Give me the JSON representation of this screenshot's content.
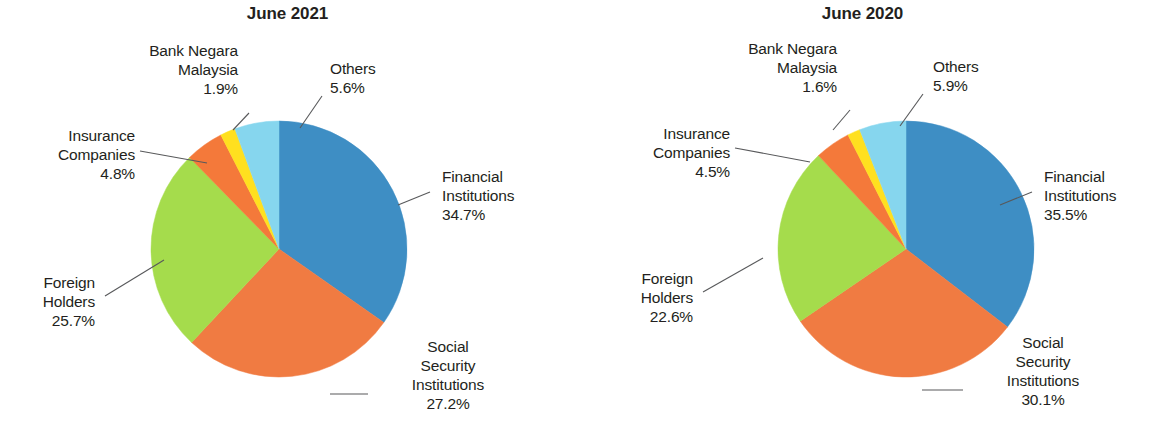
{
  "colors": {
    "financial_institutions": "#3e8ec4",
    "social_security_institutions": "#f07b42",
    "foreign_holders": "#a5dc4c",
    "insurance_companies": "#f4793a",
    "bank_negara_malaysia": "#ffe01f",
    "others": "#86d6ee",
    "leader_line": "#58595b",
    "text": "#231f20",
    "background": "#ffffff"
  },
  "charts": [
    {
      "title": "June 2021",
      "labels": {
        "financial_institutions": {
          "name_line1": "Financial",
          "name_line2": "Institutions",
          "value": "34.7%"
        },
        "social_security": {
          "name_line1": "Social",
          "name_line2": "Security",
          "name_line3": "Institutions",
          "value": "27.2%"
        },
        "foreign_holders": {
          "name_line1": "Foreign",
          "name_line2": "Holders",
          "value": "25.7%"
        },
        "insurance_companies": {
          "name_line1": "Insurance",
          "name_line2": "Companies",
          "value": "4.8%"
        },
        "bank_negara": {
          "name_line1": "Bank Negara",
          "name_line2": "Malaysia",
          "value": "1.9%"
        },
        "others": {
          "name_line1": "Others",
          "value": "5.6%"
        }
      }
    },
    {
      "title": "June 2020",
      "labels": {
        "financial_institutions": {
          "name_line1": "Financial",
          "name_line2": "Institutions",
          "value": "35.5%"
        },
        "social_security": {
          "name_line1": "Social",
          "name_line2": "Security",
          "name_line3": "Institutions",
          "value": "30.1%"
        },
        "foreign_holders": {
          "name_line1": "Foreign",
          "name_line2": "Holders",
          "value": "22.6%"
        },
        "insurance_companies": {
          "name_line1": "Insurance",
          "name_line2": "Companies",
          "value": "4.5%"
        },
        "bank_negara": {
          "name_line1": "Bank Negara",
          "name_line2": "Malaysia",
          "value": "1.6%"
        },
        "others": {
          "name_line1": "Others",
          "value": "5.9%"
        }
      }
    }
  ],
  "chart_data": [
    {
      "type": "pie",
      "title": "June 2021",
      "categories": [
        "Financial Institutions",
        "Social Security Institutions",
        "Foreign Holders",
        "Insurance Companies",
        "Bank Negara Malaysia",
        "Others"
      ],
      "values": [
        34.7,
        27.2,
        25.7,
        4.8,
        1.9,
        5.6
      ],
      "unit": "%",
      "colors": [
        "#3e8ec4",
        "#f07b42",
        "#a5dc4c",
        "#f4793a",
        "#ffe01f",
        "#86d6ee"
      ],
      "start_angle_deg": 0,
      "direction": "clockwise",
      "legend": "callout-labels",
      "grid": false,
      "xlabel": "",
      "ylabel": ""
    },
    {
      "type": "pie",
      "title": "June 2020",
      "categories": [
        "Financial Institutions",
        "Social Security Institutions",
        "Foreign Holders",
        "Insurance Companies",
        "Bank Negara Malaysia",
        "Others"
      ],
      "values": [
        35.5,
        30.1,
        22.6,
        4.5,
        1.6,
        5.9
      ],
      "unit": "%",
      "colors": [
        "#3e8ec4",
        "#f07b42",
        "#a5dc4c",
        "#f4793a",
        "#ffe01f",
        "#86d6ee"
      ],
      "start_angle_deg": 0,
      "direction": "clockwise",
      "legend": "callout-labels",
      "grid": false,
      "xlabel": "",
      "ylabel": ""
    }
  ]
}
